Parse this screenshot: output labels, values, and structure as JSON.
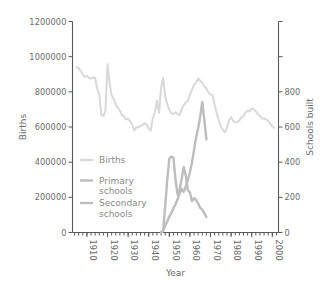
{
  "chart_data": {
    "type": "line",
    "title": "",
    "xlabel": "Year",
    "ylabel": "Births",
    "y2label": "Schools built",
    "xlim": [
      1903,
      2003
    ],
    "ylim": [
      0,
      1200000
    ],
    "y2lim": [
      0,
      1200
    ],
    "grid": false,
    "legend_position": "center-left",
    "xticks": [
      "1910",
      "1920",
      "1930",
      "1940",
      "1950",
      "1960",
      "1970",
      "1980",
      "1990",
      "2000"
    ],
    "xtick_values": [
      1910,
      1920,
      1930,
      1940,
      1950,
      1960,
      1970,
      1980,
      1990,
      2000
    ],
    "yticks": [
      "0",
      "200000",
      "400000",
      "600000",
      "800000",
      "1000000",
      "1200000"
    ],
    "ytick_values": [
      0,
      200000,
      400000,
      600000,
      800000,
      1000000,
      1200000
    ],
    "y2ticks": [
      "0",
      "200",
      "400",
      "600",
      "800",
      "",
      ""
    ],
    "y2tick_values": [
      0,
      200,
      400,
      600,
      800,
      1000,
      1200
    ],
    "series": [
      {
        "name": "Births",
        "axis": "left",
        "color": "#d9d9d9",
        "width": 2.0,
        "x": [
          1905,
          1906,
          1907,
          1908,
          1909,
          1910,
          1911,
          1912,
          1913,
          1914,
          1915,
          1916,
          1917,
          1918,
          1919,
          1920,
          1921,
          1922,
          1923,
          1924,
          1925,
          1926,
          1927,
          1928,
          1929,
          1930,
          1931,
          1932,
          1933,
          1934,
          1935,
          1936,
          1937,
          1938,
          1939,
          1940,
          1941,
          1942,
          1943,
          1944,
          1945,
          1946,
          1947,
          1948,
          1949,
          1950,
          1951,
          1952,
          1953,
          1954,
          1955,
          1956,
          1957,
          1958,
          1959,
          1960,
          1961,
          1962,
          1963,
          1964,
          1965,
          1966,
          1967,
          1968,
          1969,
          1970,
          1971,
          1972,
          1973,
          1974,
          1975,
          1976,
          1977,
          1978,
          1979,
          1980,
          1981,
          1982,
          1983,
          1984,
          1985,
          1986,
          1987,
          1988,
          1989,
          1990,
          1991,
          1992,
          1993,
          1994,
          1995,
          1996,
          1997,
          1998,
          1999,
          2000,
          2001
        ],
        "y": [
          940000,
          935000,
          918000,
          900000,
          885000,
          890000,
          880000,
          875000,
          882000,
          880000,
          815000,
          785000,
          668000,
          663000,
          692000,
          958000,
          848000,
          780000,
          758000,
          730000,
          710000,
          694000,
          668000,
          660000,
          643000,
          648000,
          632000,
          614000,
          580000,
          598000,
          599000,
          605000,
          611000,
          621000,
          614000,
          590000,
          579000,
          652000,
          684000,
          751000,
          680000,
          821000,
          881000,
          775000,
          730000,
          697000,
          677000,
          674000,
          684000,
          674000,
          668000,
          700000,
          723000,
          740000,
          748000,
          785000,
          811000,
          839000,
          854000,
          876000,
          863000,
          850000,
          832000,
          819000,
          797000,
          784000,
          783000,
          725000,
          676000,
          640000,
          603000,
          584000,
          569000,
          597000,
          638000,
          656000,
          634000,
          626000,
          629000,
          637000,
          656000,
          661000,
          682000,
          694000,
          688000,
          706000,
          699000,
          689000,
          673000,
          664000,
          648000,
          649000,
          643000,
          635000,
          621000,
          604000,
          595000
        ]
      },
      {
        "name": "Primary schools",
        "axis": "right",
        "color": "#bdbdbd",
        "width": 2.4,
        "x": [
          1946,
          1947,
          1948,
          1949,
          1950,
          1951,
          1952,
          1953,
          1954,
          1955,
          1956,
          1957,
          1958,
          1959,
          1960,
          1961,
          1962,
          1963,
          1964,
          1965,
          1966,
          1967,
          1968
        ],
        "y": [
          3,
          10,
          150,
          300,
          420,
          432,
          425,
          300,
          215,
          245,
          305,
          372,
          325,
          240,
          228,
          178,
          195,
          185,
          165,
          140,
          130,
          110,
          88
        ]
      },
      {
        "name": "Secondary schools",
        "axis": "right",
        "color": "#bdbdbd",
        "width": 2.4,
        "x": [
          1946,
          1947,
          1948,
          1949,
          1950,
          1951,
          1952,
          1953,
          1954,
          1955,
          1956,
          1957,
          1958,
          1959,
          1960,
          1961,
          1962,
          1963,
          1964,
          1965,
          1966,
          1967,
          1968
        ],
        "y": [
          2,
          8,
          38,
          62,
          92,
          110,
          138,
          160,
          190,
          222,
          248,
          232,
          262,
          300,
          342,
          398,
          470,
          540,
          595,
          660,
          742,
          640,
          530
        ]
      }
    ],
    "legend": [
      {
        "label_lines": [
          "Births"
        ],
        "color": "#d9d9d9"
      },
      {
        "label_lines": [
          "Primary",
          "schools"
        ],
        "color": "#bdbdbd"
      },
      {
        "label_lines": [
          "Secondary",
          "schools"
        ],
        "color": "#bdbdbd"
      }
    ]
  }
}
